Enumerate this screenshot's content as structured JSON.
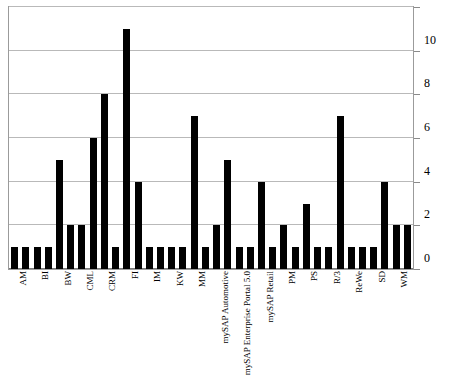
{
  "chart_data": {
    "type": "bar",
    "title": "",
    "subtitle": "",
    "xlabel": "",
    "ylabel": "",
    "ylim": [
      0,
      12
    ],
    "yticks": [
      0,
      2,
      4,
      6,
      8,
      10,
      12
    ],
    "ytick_labels": [
      "0",
      "2",
      "4",
      "6",
      "8",
      "10",
      "12"
    ],
    "grid": true,
    "legend": false,
    "legend_position": "none",
    "orientation": "vertical",
    "bar_color": "#000000",
    "grid_color": "#b9b9b9",
    "axis_color": "#9b9b9b",
    "categories": [
      "AM",
      "",
      "BI",
      "",
      "BW",
      "",
      "CML",
      "",
      "CRM",
      "",
      "FI",
      "",
      "IM",
      "",
      "KW",
      "",
      "MM",
      "",
      "mySAP Automotive",
      "",
      "mySAP Enterprise Portal 5.0",
      "",
      "mySAP Retail",
      "",
      "PM",
      "",
      "PS",
      "",
      "R/3",
      "",
      "ReWe",
      "",
      "SD",
      "",
      "WM",
      ""
    ],
    "labeled_categories": [
      "AM",
      "BI",
      "BW",
      "CML",
      "CRM",
      "FI",
      "IM",
      "KW",
      "MM",
      "mySAP Automotive",
      "mySAP Enterprise Portal 5.0",
      "mySAP Retail",
      "PM",
      "PS",
      "R/3",
      "ReWe",
      "SD",
      "WM"
    ],
    "values": [
      1,
      1,
      1,
      1,
      5,
      2,
      2,
      6,
      8,
      1,
      11,
      4,
      1,
      1,
      1,
      1,
      7,
      1,
      2,
      5,
      1,
      1,
      4,
      1,
      2,
      1,
      3,
      1,
      1,
      7,
      1,
      1,
      1,
      4,
      2,
      2
    ],
    "bar_count": 36,
    "max_value": 11,
    "min_value": 1
  }
}
